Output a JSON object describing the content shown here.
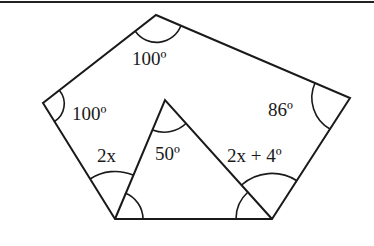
{
  "diagram": {
    "type": "geometry",
    "pentagon": {
      "vertices": {
        "top": [
          156,
          15
        ],
        "left": [
          43,
          103
        ],
        "bottom_left": [
          115,
          219
        ],
        "bottom_right": [
          272,
          219
        ],
        "right": [
          350,
          98
        ]
      }
    },
    "triangle": {
      "vertices": {
        "apex": [
          165,
          100
        ],
        "bottom_left": [
          115,
          219
        ],
        "bottom_right": [
          272,
          219
        ]
      }
    },
    "angle_labels": {
      "top": "100º",
      "left": "100º",
      "right": "86º",
      "triangle_apex": "50º",
      "bottom_left_outer": "2x",
      "bottom_right_outer": "2x + 4º"
    },
    "colors": {
      "stroke": "#1a1a1a",
      "background": "#ffffff"
    }
  }
}
